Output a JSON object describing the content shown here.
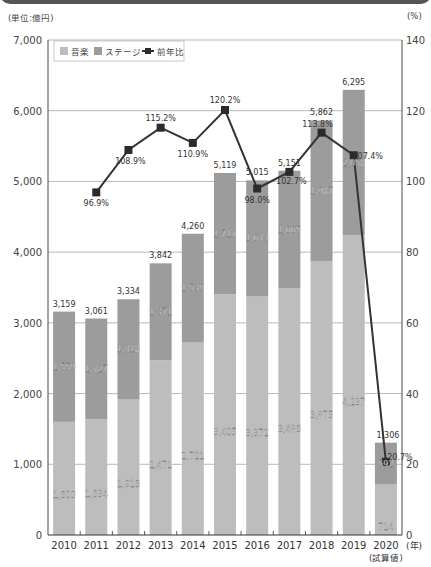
{
  "header": {
    "title_partial": ""
  },
  "axes": {
    "left_unit": "(単位:億円)",
    "right_unit": "(%)",
    "x_unit": "(年)",
    "x_note": "(試算値)"
  },
  "legend": {
    "music": "音楽",
    "stage": "ステージ",
    "yoy": "前年比"
  },
  "colors": {
    "music": "#bdbdbd",
    "stage": "#9c9c9c",
    "line": "#333333",
    "marker": "#2b2b2b",
    "grid": "#9a9a9a",
    "header": "#555555"
  },
  "chart_data": {
    "type": "bar",
    "stacked": true,
    "title": "",
    "categories": [
      "2010",
      "2011",
      "2012",
      "2013",
      "2014",
      "2015",
      "2016",
      "2017",
      "2018",
      "2019",
      "2020"
    ],
    "series": [
      {
        "name": "音楽",
        "values": [
          1600,
          1634,
          1916,
          2471,
          2721,
          3405,
          3372,
          3486,
          3875,
          4237,
          714
        ]
      },
      {
        "name": "ステージ",
        "values": [
          1559,
          1427,
          1418,
          1371,
          1539,
          1714,
          1643,
          1665,
          1987,
          2058,
          592
        ]
      },
      {
        "name": "前年比",
        "type": "line",
        "axis": "right",
        "values": [
          null,
          96.9,
          108.9,
          115.2,
          110.9,
          120.2,
          98.0,
          102.7,
          113.8,
          107.4,
          20.7
        ]
      }
    ],
    "totals": [
      3159,
      3061,
      3334,
      3842,
      4260,
      5119,
      5015,
      5151,
      5862,
      6295,
      1306
    ],
    "total_labels": [
      "3,159",
      "3,061",
      "3,334",
      "3,842",
      "4,260",
      "5,119",
      "5,015",
      "5,151",
      "5,862",
      "6,295",
      "1,306"
    ],
    "music_labels": [
      "1,600",
      "1,634",
      "1,916",
      "2,471",
      "2,721",
      "3,405",
      "3,372",
      "3,486",
      "3,875",
      "4,237",
      "714"
    ],
    "stage_labels": [
      "1,559",
      "1,427",
      "1,418",
      "1,371",
      "1,539",
      "1,714",
      "1,643",
      "1,665",
      "1,987",
      "2,058",
      "592"
    ],
    "yoy_labels": [
      "",
      "96.9%",
      "108.9%",
      "115.2%",
      "110.9%",
      "120.2%",
      "98.0%",
      "102.7%",
      "113.8%",
      "107.4%",
      "20.7%"
    ],
    "xlabel": "(年)",
    "xlabel_note": "2020 (試算値)",
    "ylabel": "(単位:億円)",
    "ylabel_right": "(%)",
    "ylim": [
      0,
      7000
    ],
    "yticks": [
      "0",
      "1,000",
      "2,000",
      "3,000",
      "4,000",
      "5,000",
      "6,000",
      "7,000"
    ],
    "ylim_right": [
      0,
      140
    ],
    "yticks_right": [
      "0",
      "20",
      "40",
      "60",
      "80",
      "100",
      "120",
      "140"
    ],
    "grid": true,
    "legend_position": "top-left"
  }
}
